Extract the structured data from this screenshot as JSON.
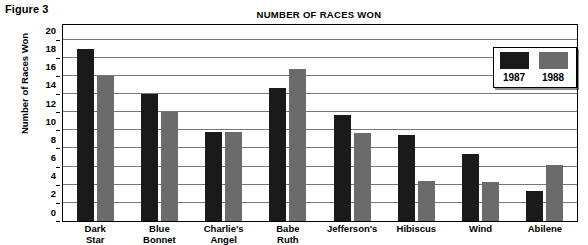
{
  "figure": {
    "caption": "Figure 3"
  },
  "chart_data": {
    "type": "bar",
    "title": "NUMBER OF RACES WON",
    "xlabel": "",
    "ylabel": "Number of Races Won",
    "ylim": [
      0,
      21.6
    ],
    "yticks": [
      0,
      2,
      4,
      6,
      8,
      10,
      12,
      14,
      16,
      18,
      20
    ],
    "ytick_labels": [
      "0",
      "2",
      "4",
      "6",
      "8",
      "10",
      "12",
      "14",
      "16",
      "18",
      "20"
    ],
    "grid": true,
    "grid_axis": "y",
    "legend_position": "top-right",
    "categories": [
      "Dark Star",
      "Blue Bonnet",
      "Charlie's Angel",
      "Babe Ruth",
      "Jefferson's",
      "Hibiscus",
      "Wind",
      "Abilene"
    ],
    "category_lines": [
      [
        "Dark",
        "Star"
      ],
      [
        "Blue",
        "Bonnet"
      ],
      [
        "Charlie's",
        "Angel"
      ],
      [
        "Babe",
        "Ruth"
      ],
      [
        "Jefferson's",
        ""
      ],
      [
        "Hibiscus",
        ""
      ],
      [
        "Wind",
        ""
      ],
      [
        "Abilene",
        ""
      ]
    ],
    "series": [
      {
        "name": "1987",
        "color": "#1a1a1a",
        "values": [
          19.0,
          14.0,
          9.8,
          14.7,
          11.7,
          9.5,
          7.4,
          3.3
        ]
      },
      {
        "name": "1988",
        "color": "#6b6b6b",
        "values": [
          16.0,
          12.0,
          9.8,
          16.7,
          9.7,
          4.4,
          4.3,
          6.2
        ]
      }
    ]
  },
  "legend": {
    "entries": [
      {
        "label": "1987",
        "color": "#1a1a1a"
      },
      {
        "label": "1988",
        "color": "#6b6b6b"
      }
    ]
  }
}
